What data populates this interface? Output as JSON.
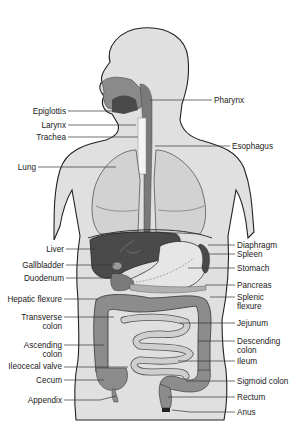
{
  "figure": {
    "colors": {
      "body_fill": "#e0e0e0",
      "body_outline": "#222222",
      "lung_fill": "#d2d2d2",
      "organ_dark": "#4a4a4a",
      "colon_fill": "#8c8c8c",
      "small_intestine": "#cfcfcf",
      "stomach_fill": "#e6e6e6",
      "leader_line": "#333333"
    }
  },
  "labels_left": [
    {
      "id": "epiglottis",
      "lines": [
        "Epiglottis"
      ],
      "x_end": 66,
      "y": 107,
      "target": [
        112,
        111
      ]
    },
    {
      "id": "larynx",
      "lines": [
        "Larynx"
      ],
      "x_end": 66,
      "y": 121,
      "target": [
        136,
        125
      ]
    },
    {
      "id": "trachea",
      "lines": [
        "Trachea"
      ],
      "x_end": 66,
      "y": 133,
      "target": [
        138,
        137
      ]
    },
    {
      "id": "lung",
      "lines": [
        "Lung"
      ],
      "x_end": 36,
      "y": 163,
      "target": [
        116,
        167
      ]
    },
    {
      "id": "liver",
      "lines": [
        "Liver"
      ],
      "x_end": 64,
      "y": 245,
      "target": [
        95,
        249
      ]
    },
    {
      "id": "gallbladder",
      "lines": [
        "Gallbladder"
      ],
      "x_end": 64,
      "y": 261,
      "target": [
        115,
        265
      ]
    },
    {
      "id": "duodenum",
      "lines": [
        "Duodenum"
      ],
      "x_end": 64,
      "y": 274,
      "target": [
        112,
        278
      ]
    },
    {
      "id": "hepatic-flexure",
      "lines": [
        "Hepatic flexure"
      ],
      "x_end": 62,
      "y": 295,
      "target": [
        98,
        299
      ]
    },
    {
      "id": "transverse-colon",
      "lines": [
        "Transverse",
        "colon"
      ],
      "x_end": 62,
      "y": 313,
      "target": [
        114,
        317
      ]
    },
    {
      "id": "ascending-colon",
      "lines": [
        "Ascending",
        "colon"
      ],
      "x_end": 62,
      "y": 341,
      "target": [
        110,
        345
      ]
    },
    {
      "id": "ileocecal-valve",
      "lines": [
        "Ileocecal valve"
      ],
      "x_end": 62,
      "y": 362,
      "target": [
        128,
        367
      ]
    },
    {
      "id": "cecum",
      "lines": [
        "Cecum"
      ],
      "x_end": 62,
      "y": 376,
      "target": [
        108,
        380
      ]
    },
    {
      "id": "appendix",
      "lines": [
        "Appendix"
      ],
      "x_end": 62,
      "y": 396,
      "target": [
        116,
        398
      ]
    }
  ],
  "labels_right": [
    {
      "id": "pharynx",
      "lines": [
        "Pharynx"
      ],
      "x_start": 214,
      "y": 96,
      "target": [
        150,
        100
      ]
    },
    {
      "id": "esophagus",
      "lines": [
        "Esophagus"
      ],
      "x_start": 232,
      "y": 142,
      "target": [
        155,
        146
      ]
    },
    {
      "id": "diaphragm",
      "lines": [
        "Diaphragm"
      ],
      "x_start": 237,
      "y": 241,
      "target": [
        208,
        245
      ]
    },
    {
      "id": "spleen",
      "lines": [
        "Spleen"
      ],
      "x_start": 237,
      "y": 250,
      "target": [
        205,
        254
      ]
    },
    {
      "id": "stomach",
      "lines": [
        "Stomach"
      ],
      "x_start": 237,
      "y": 264,
      "target": [
        188,
        268
      ]
    },
    {
      "id": "pancreas",
      "lines": [
        "Pancreas"
      ],
      "x_start": 237,
      "y": 281,
      "target": [
        205,
        285
      ]
    },
    {
      "id": "splenic-flexure",
      "lines": [
        "Splenic",
        "flexure"
      ],
      "x_start": 237,
      "y": 293,
      "target": [
        210,
        297
      ]
    },
    {
      "id": "jejunum",
      "lines": [
        "Jejunum"
      ],
      "x_start": 237,
      "y": 319,
      "target": [
        180,
        323
      ]
    },
    {
      "id": "descending-colon",
      "lines": [
        "Descending",
        "colon"
      ],
      "x_start": 237,
      "y": 337,
      "target": [
        198,
        341
      ]
    },
    {
      "id": "ileum",
      "lines": [
        "Ileum"
      ],
      "x_start": 237,
      "y": 357,
      "target": [
        178,
        361
      ]
    },
    {
      "id": "sigmoid-colon",
      "lines": [
        "Sigmoid colon"
      ],
      "x_start": 237,
      "y": 377,
      "target": [
        186,
        381
      ]
    },
    {
      "id": "rectum",
      "lines": [
        "Rectum"
      ],
      "x_start": 237,
      "y": 393,
      "target": [
        168,
        397
      ]
    },
    {
      "id": "anus",
      "lines": [
        "Anus"
      ],
      "x_start": 237,
      "y": 408,
      "target": [
        172,
        412
      ]
    }
  ]
}
